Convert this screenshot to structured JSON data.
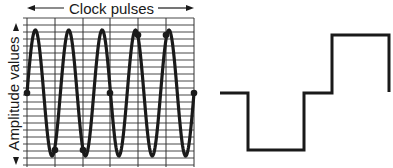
{
  "diagram": {
    "top_label": "Clock pulses",
    "side_label": "Amplitude values",
    "colors": {
      "line": "#1a1a1a",
      "grid": "#333333",
      "background": "#ffffff"
    },
    "left_panel": {
      "type": "sampled-sine",
      "grid": {
        "x_min": 27,
        "x_max": 194,
        "y_min": 18,
        "y_max": 165,
        "vertical_lines": [
          27,
          55,
          83,
          110,
          138,
          166,
          194
        ],
        "horizontal_spacing": 7
      },
      "wave": {
        "center_y": 93,
        "amplitude": 63,
        "period": 33.4,
        "x_start": 27,
        "x_end": 194
      },
      "sample_points": [
        {
          "x": 27,
          "y": 93
        },
        {
          "x": 55,
          "y": 150
        },
        {
          "x": 83,
          "y": 150
        },
        {
          "x": 110,
          "y": 93
        },
        {
          "x": 138,
          "y": 35
        },
        {
          "x": 166,
          "y": 35
        },
        {
          "x": 194,
          "y": 93
        }
      ]
    },
    "right_panel": {
      "type": "step-reconstruction",
      "points": [
        [
          220,
          93
        ],
        [
          248,
          93
        ],
        [
          248,
          150
        ],
        [
          304,
          150
        ],
        [
          304,
          93
        ],
        [
          332,
          93
        ],
        [
          332,
          35
        ],
        [
          389,
          35
        ],
        [
          389,
          92
        ]
      ]
    }
  }
}
